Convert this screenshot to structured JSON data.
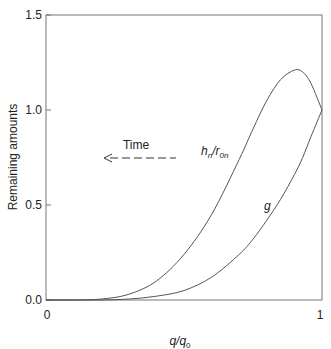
{
  "chart_data": {
    "type": "line",
    "title": "",
    "xlabel": "q/q0",
    "xlabel_main": "q/q",
    "xlabel_sub": "0",
    "ylabel": "Remaining amounts",
    "xlim": [
      0,
      1
    ],
    "ylim": [
      0,
      1.5
    ],
    "grid": false,
    "legend": "none (curves labeled inline)",
    "x_ticks": [
      {
        "value": 0,
        "label": "0"
      },
      {
        "value": 1,
        "label": "1"
      }
    ],
    "y_ticks": [
      {
        "value": 0.0,
        "label": "0.0"
      },
      {
        "value": 0.5,
        "label": "0.5"
      },
      {
        "value": 1.0,
        "label": "1.0"
      },
      {
        "value": 1.5,
        "label": "1.5"
      }
    ],
    "x": [
      0,
      0.1,
      0.2,
      0.3,
      0.4,
      0.5,
      0.6,
      0.7,
      0.75,
      0.8,
      0.85,
      0.9,
      0.93,
      0.96,
      1.0
    ],
    "series": [
      {
        "name": "h_n/r_0n",
        "label_main": "h",
        "label_sub1": "n",
        "label_mid": "/r",
        "label_sub2": "0n",
        "values": [
          0,
          0.0,
          0.005,
          0.03,
          0.1,
          0.24,
          0.45,
          0.74,
          0.9,
          1.05,
          1.16,
          1.21,
          1.2,
          1.14,
          1.0
        ]
      },
      {
        "name": "g",
        "label_main": "g",
        "values": [
          0,
          0.0,
          0.0,
          0.005,
          0.02,
          0.05,
          0.12,
          0.24,
          0.32,
          0.42,
          0.53,
          0.66,
          0.75,
          0.86,
          1.0
        ]
      }
    ],
    "annotations": [
      {
        "text": "Time",
        "type": "label"
      },
      {
        "text": "arrow pointing left (dashed)",
        "type": "arrow",
        "direction": "left"
      }
    ]
  },
  "labels": {
    "time": "Time",
    "ylabel": "Remaining amounts",
    "xlabel_main": "q/q",
    "xlabel_sub": "0",
    "h_main": "h",
    "h_sub1": "n",
    "h_mid": "/r",
    "h_sub2": "0n",
    "g": "g",
    "x0": "0",
    "x1": "1",
    "y0": "0.0",
    "y05": "0.5",
    "y10": "1.0",
    "y15": "1.5"
  }
}
